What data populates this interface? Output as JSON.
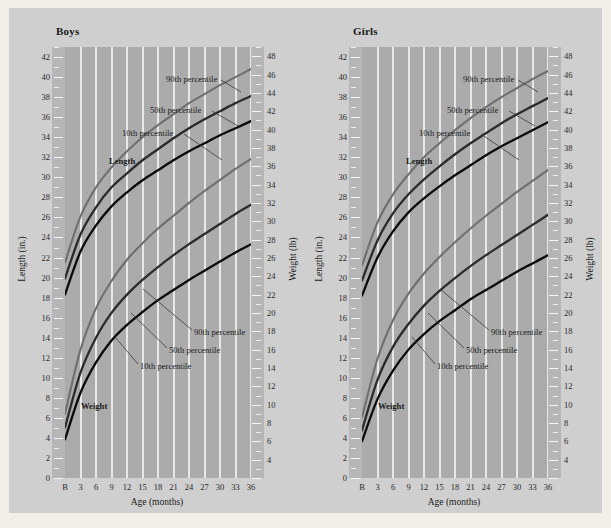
{
  "figure": {
    "background": "#cfcfcf",
    "page_background": "#f2efe9",
    "plot_background": "#ababab",
    "tickstrip_background": "#b6b6b6",
    "gridline_color": "#e8e8e8",
    "color_90th": "#6f6f6f",
    "color_50th": "#2b2b2b",
    "color_10th": "#0a0a0a"
  },
  "panels": [
    {
      "title": "Boys"
    },
    {
      "title": "Girls"
    }
  ],
  "axes": {
    "x_title": "Age (months)",
    "x_ticks": [
      "B",
      "3",
      "6",
      "9",
      "12",
      "15",
      "18",
      "21",
      "24",
      "27",
      "30",
      "33",
      "36"
    ],
    "y_left_title": "Length (in.)",
    "y_left_ticks": [
      "42",
      "40",
      "38",
      "36",
      "34",
      "32",
      "30",
      "28",
      "26",
      "24",
      "22",
      "20",
      "18",
      "16",
      "14",
      "12",
      "10",
      "8",
      "6",
      "4",
      "2",
      "0"
    ],
    "y_right_title": "Weight (lb)",
    "y_right_ticks": [
      "48",
      "46",
      "44",
      "42",
      "40",
      "38",
      "36",
      "34",
      "32",
      "30",
      "28",
      "26",
      "24",
      "22",
      "20",
      "18",
      "16",
      "14",
      "12",
      "10",
      "8",
      "6",
      "4"
    ]
  },
  "annotations": {
    "length_group": "Length",
    "weight_group": "Weight",
    "p90": "90th percentile",
    "p50": "50th percentile",
    "p10": "10th percentile"
  },
  "chart_data": {
    "type": "line",
    "xlabel": "Age (months)",
    "x_tick_labels": [
      "B",
      "3",
      "6",
      "9",
      "12",
      "15",
      "18",
      "21",
      "24",
      "27",
      "30",
      "33",
      "36"
    ],
    "x": [
      0,
      3,
      6,
      9,
      12,
      15,
      18,
      21,
      24,
      27,
      30,
      33,
      36
    ],
    "xlim": [
      0,
      36
    ],
    "grid": "vertical gridlines at every 3 months",
    "legend": "inline curve annotations (90th / 50th / 10th percentile)",
    "panels": [
      {
        "name": "Boys",
        "length": {
          "ylabel": "Length (in.)",
          "ylim": [
            0,
            43
          ],
          "unit": "in.",
          "series": [
            {
              "name": "90th percentile",
              "color": "#6f6f6f",
              "values": [
                21.5,
                26.1,
                29.0,
                31.0,
                32.6,
                34.0,
                35.2,
                36.3,
                37.4,
                38.3,
                39.2,
                40.0,
                40.8
              ]
            },
            {
              "name": "50th percentile",
              "color": "#2b2b2b",
              "values": [
                19.9,
                24.3,
                27.0,
                29.0,
                30.4,
                31.7,
                32.8,
                33.9,
                34.9,
                35.8,
                36.6,
                37.4,
                38.1
              ]
            },
            {
              "name": "10th percentile",
              "color": "#0a0a0a",
              "values": [
                18.3,
                22.6,
                25.2,
                27.1,
                28.5,
                29.7,
                30.7,
                31.7,
                32.6,
                33.4,
                34.2,
                34.9,
                35.6
              ]
            }
          ]
        },
        "weight": {
          "ylabel": "Weight (lb)",
          "ylim": [
            2,
            49
          ],
          "unit": "lb",
          "series": [
            {
              "name": "90th percentile",
              "color": "#6f6f6f",
              "values": [
                9.0,
                16.0,
                20.5,
                23.5,
                25.8,
                27.6,
                29.2,
                30.6,
                32.0,
                33.3,
                34.5,
                35.7,
                36.8
              ]
            },
            {
              "name": "50th percentile",
              "color": "#2b2b2b",
              "values": [
                7.5,
                13.5,
                17.3,
                20.0,
                22.0,
                23.6,
                25.0,
                26.3,
                27.5,
                28.6,
                29.7,
                30.8,
                31.8
              ]
            },
            {
              "name": "10th percentile",
              "color": "#0a0a0a",
              "values": [
                6.2,
                11.3,
                14.6,
                17.0,
                18.7,
                20.1,
                21.4,
                22.5,
                23.6,
                24.6,
                25.6,
                26.6,
                27.5
              ]
            }
          ]
        }
      },
      {
        "name": "Girls",
        "length": {
          "ylabel": "Length (in.)",
          "ylim": [
            0,
            43
          ],
          "unit": "in.",
          "series": [
            {
              "name": "90th percentile",
              "color": "#6f6f6f",
              "values": [
                21.2,
                25.5,
                28.3,
                30.3,
                32.0,
                33.4,
                34.7,
                35.9,
                37.0,
                38.0,
                38.9,
                39.8,
                40.6
              ]
            },
            {
              "name": "50th percentile",
              "color": "#2b2b2b",
              "values": [
                19.7,
                23.7,
                26.4,
                28.3,
                29.8,
                31.1,
                32.3,
                33.4,
                34.4,
                35.4,
                36.3,
                37.1,
                37.9
              ]
            },
            {
              "name": "10th percentile",
              "color": "#0a0a0a",
              "values": [
                18.2,
                22.0,
                24.6,
                26.5,
                27.9,
                29.1,
                30.2,
                31.2,
                32.2,
                33.1,
                33.9,
                34.7,
                35.5
              ]
            }
          ]
        },
        "weight": {
          "ylabel": "Weight (lb)",
          "ylim": [
            2,
            49
          ],
          "unit": "lb",
          "series": [
            {
              "name": "90th percentile",
              "color": "#6f6f6f",
              "values": [
                8.6,
                15.0,
                19.2,
                22.1,
                24.3,
                26.1,
                27.7,
                29.2,
                30.6,
                31.9,
                33.2,
                34.4,
                35.6
              ]
            },
            {
              "name": "50th percentile",
              "color": "#2b2b2b",
              "values": [
                7.2,
                12.7,
                16.3,
                18.8,
                20.8,
                22.4,
                23.8,
                25.1,
                26.3,
                27.4,
                28.5,
                29.6,
                30.7
              ]
            },
            {
              "name": "10th percentile",
              "color": "#0a0a0a",
              "values": [
                6.0,
                10.6,
                13.7,
                16.0,
                17.7,
                19.1,
                20.3,
                21.5,
                22.5,
                23.5,
                24.5,
                25.4,
                26.3
              ]
            }
          ]
        }
      }
    ]
  }
}
